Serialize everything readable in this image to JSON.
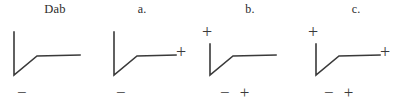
{
  "figure": {
    "background_color": "#ffffff",
    "stroke_color": "#3a3a3a",
    "text_color": "#2b2b2b",
    "panel_count": 4
  },
  "panels": [
    {
      "label": "Dab",
      "waveform": "deep-negative-deflection-with-plateau",
      "sign_top": "",
      "sign_right": "",
      "sign_bottom": "−"
    },
    {
      "label": "a.",
      "waveform": "deep-negative-deflection-with-plateau",
      "sign_top": "",
      "sign_right": "+",
      "sign_bottom": "−"
    },
    {
      "label": "b.",
      "waveform": "deep-negative-deflection-with-plateau",
      "sign_top": "+",
      "sign_right": "",
      "sign_bottom": "− +"
    },
    {
      "label": "c.",
      "waveform": "deep-negative-deflection-with-plateau",
      "sign_top": "+",
      "sign_right": "+",
      "sign_bottom": "− +"
    }
  ]
}
